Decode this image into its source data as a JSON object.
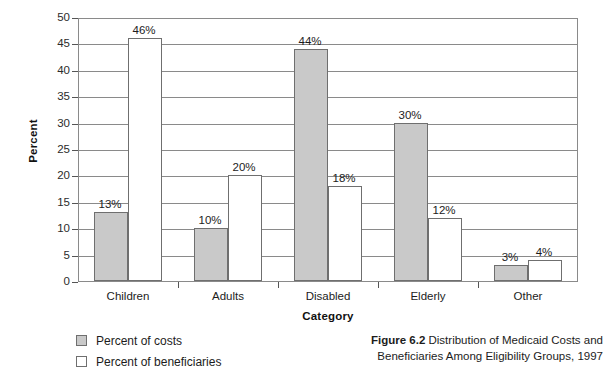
{
  "chart_data": {
    "type": "bar",
    "title": "",
    "xlabel": "Category",
    "ylabel": "Percent",
    "ylim": [
      0,
      50
    ],
    "ytick_step": 5,
    "yticks": [
      "0",
      "5",
      "10",
      "15",
      "20",
      "25",
      "30",
      "35",
      "40",
      "45",
      "50"
    ],
    "grid": true,
    "legend_position": "below-left",
    "categories": [
      "Children",
      "Adults",
      "Disabled",
      "Elderly",
      "Other"
    ],
    "series": [
      {
        "name": "Percent of costs",
        "color": "#c9c9c9",
        "values": [
          13,
          10,
          44,
          30,
          3
        ],
        "labels": [
          "13%",
          "10%",
          "44%",
          "30%",
          "3%"
        ]
      },
      {
        "name": "Percent of beneficiaries",
        "color": "#ffffff",
        "values": [
          46,
          20,
          18,
          12,
          4
        ],
        "labels": [
          "46%",
          "20%",
          "18%",
          "12%",
          "4%"
        ]
      }
    ]
  },
  "caption": {
    "figure_number": "Figure 6.2",
    "text": "Distribution of Medicaid Costs and Beneficiaries Among Eligibility Groups, 1997"
  },
  "colors": {
    "costs_fill": "#c9c9c9",
    "beneficiaries_fill": "#ffffff",
    "axis": "#8a8a8a",
    "text": "#1c1c1c"
  }
}
